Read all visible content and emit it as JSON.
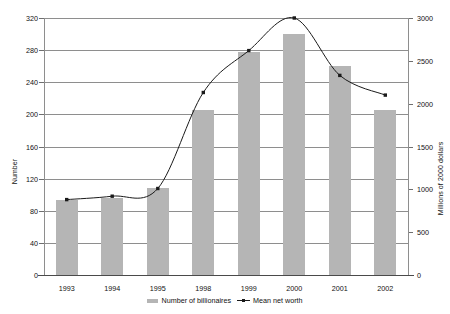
{
  "chart_data": {
    "type": "bar",
    "title": "",
    "subtitle": "",
    "categories": [
      "1993",
      "1994",
      "1995",
      "1998",
      "1999",
      "2000",
      "2001",
      "2002"
    ],
    "xlabel": "",
    "grid": true,
    "legend_position": "bottom",
    "series": [
      {
        "name": "Number of billionaires",
        "type": "bar",
        "axis": "left",
        "color": "#b5b5b5",
        "values": [
          94,
          96,
          108,
          205,
          278,
          300,
          260,
          205
        ]
      },
      {
        "name": "Mean net worth",
        "type": "line",
        "axis": "right",
        "color": "#1a1a1a",
        "values": [
          880,
          920,
          1010,
          2130,
          2620,
          3000,
          2330,
          2100
        ]
      }
    ],
    "left_axis": {
      "label": "Number",
      "ticks": [
        0,
        40,
        80,
        120,
        160,
        200,
        240,
        280,
        320
      ],
      "ylim": [
        0,
        320
      ]
    },
    "right_axis": {
      "label": "Millions of 2000 dollars",
      "ticks": [
        0,
        500,
        1000,
        1500,
        2000,
        2500,
        3000
      ],
      "ylim": [
        0,
        3000
      ]
    }
  },
  "legend": {
    "bar_label": "Number of billionaires",
    "line_label": "Mean net worth"
  }
}
